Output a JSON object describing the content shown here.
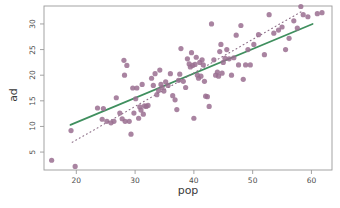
{
  "chart_data": {
    "type": "scatter",
    "title": "",
    "xlabel": "pop",
    "ylabel": "ad",
    "xlim": [
      14.5,
      63.5
    ],
    "ylim": [
      1.5,
      33.5
    ],
    "xticks": [
      20,
      30,
      40,
      50,
      60
    ],
    "yticks": [
      5,
      10,
      15,
      20,
      25,
      30
    ],
    "grid": false,
    "legend": "none",
    "point_color": "#9a6f91",
    "point_opacity": 0.85,
    "point_size": 2.6,
    "frame_color": "#9a9a9a",
    "series": [
      {
        "name": "observations",
        "x": [
          15.8,
          19.1,
          19.8,
          23.6,
          24.4,
          24.6,
          25.2,
          25.9,
          26.4,
          26.8,
          27.4,
          27.8,
          28.1,
          28.2,
          28.3,
          28.6,
          29.0,
          29.3,
          29.6,
          29.8,
          30.1,
          30.3,
          30.6,
          30.8,
          31.0,
          31.2,
          31.4,
          31.6,
          31.9,
          32.2,
          32.8,
          33.1,
          33.4,
          33.7,
          34.0,
          34.2,
          34.4,
          34.6,
          34.9,
          35.2,
          35.6,
          36.0,
          36.4,
          36.8,
          37.1,
          37.4,
          37.6,
          37.8,
          38.2,
          38.6,
          38.9,
          39.2,
          39.4,
          39.6,
          39.8,
          40.0,
          40.2,
          40.4,
          40.6,
          40.8,
          41.0,
          41.2,
          41.4,
          41.6,
          41.8,
          42.0,
          42.3,
          42.6,
          43.0,
          43.4,
          43.7,
          44.0,
          44.2,
          44.4,
          44.6,
          44.8,
          45.0,
          45.3,
          45.6,
          46.0,
          46.4,
          46.8,
          47.2,
          47.6,
          48.0,
          48.4,
          48.8,
          49.2,
          49.6,
          50.2,
          51.0,
          52.0,
          52.8,
          53.6,
          54.4,
          55.0,
          55.6,
          56.2,
          57.0,
          57.6,
          58.2,
          58.6,
          59.4,
          61.0,
          61.8
        ],
        "y": [
          3.4,
          9.2,
          2.2,
          13.6,
          11.4,
          13.5,
          11.0,
          10.7,
          11.0,
          15.6,
          12.6,
          11.5,
          22.9,
          20.0,
          11.0,
          21.9,
          11.0,
          8.5,
          17.5,
          12.6,
          15.4,
          17.5,
          11.6,
          13.8,
          13.2,
          18.2,
          12.4,
          14.0,
          13.9,
          14.1,
          19.4,
          18.0,
          20.3,
          16.2,
          17.0,
          21.0,
          18.2,
          17.6,
          16.9,
          18.7,
          18.0,
          20.3,
          16.0,
          15.2,
          13.3,
          19.0,
          20.2,
          25.2,
          18.8,
          17.6,
          23.2,
          22.2,
          21.6,
          24.4,
          21.9,
          11.6,
          22.1,
          23.5,
          20.0,
          19.4,
          22.5,
          19.8,
          23.0,
          22.0,
          18.8,
          15.9,
          15.8,
          13.9,
          30.0,
          23.0,
          20.0,
          20.6,
          19.8,
          24.6,
          26.0,
          20.4,
          22.5,
          23.3,
          25.0,
          23.2,
          20.0,
          23.4,
          27.8,
          22.0,
          29.7,
          19.2,
          22.0,
          25.0,
          22.0,
          26.0,
          27.9,
          24.0,
          31.8,
          28.2,
          28.8,
          29.4,
          25.0,
          27.2,
          30.6,
          29.2,
          33.4,
          31.8,
          31.4,
          32.0,
          32.2
        ]
      }
    ],
    "lines": [
      {
        "name": "regression-line",
        "style": "solid",
        "color": "#3f8f5e",
        "width": 1.7,
        "x": [
          19.0,
          60.2
        ],
        "y": [
          10.3,
          30.0
        ]
      },
      {
        "name": "reference-line",
        "style": "dotted",
        "color": "#8d6f88",
        "width": 1.1,
        "x": [
          19.3,
          58.6
        ],
        "y": [
          6.9,
          32.6
        ]
      }
    ]
  }
}
